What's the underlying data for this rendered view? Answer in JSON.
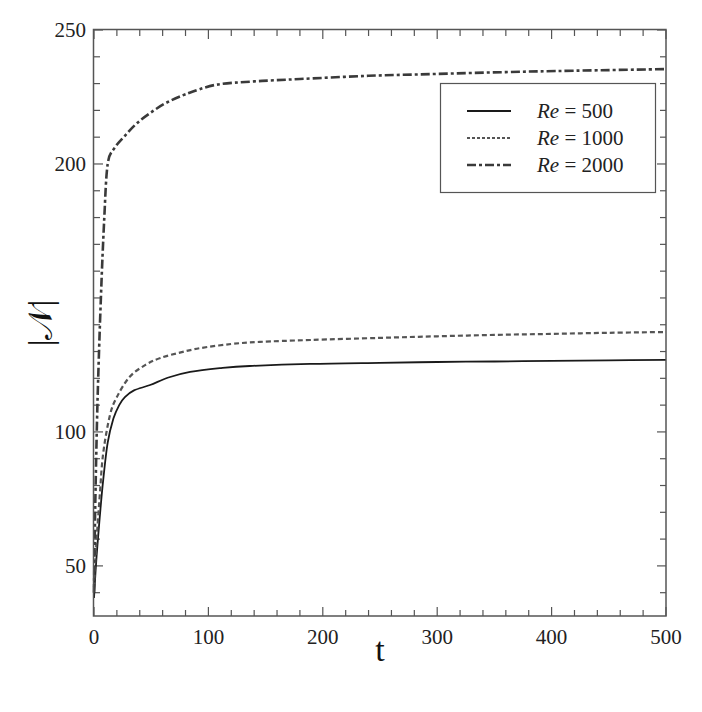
{
  "chart_data": {
    "type": "line",
    "title": "",
    "xlabel": "t",
    "ylabel": "|𝒩|",
    "xlim": [
      0,
      500
    ],
    "ylim": [
      31.3,
      250
    ],
    "xticks": [
      0,
      100,
      200,
      300,
      400,
      500
    ],
    "xtick_labels": [
      "0",
      "100",
      "200",
      "300",
      "400",
      "500"
    ],
    "yticks": [
      50,
      100,
      200,
      250
    ],
    "ytick_labels": [
      "50",
      "100",
      "200",
      "250"
    ],
    "x_minor_step": 20,
    "y_minor_step": 10,
    "grid": false,
    "legend_position": "upper right",
    "series": [
      {
        "name": "Re = 500",
        "label_italic": "Re",
        "label_rest": " = 500",
        "style": "solid",
        "color": "#1a1a1a",
        "x": [
          0,
          2,
          5,
          8,
          12,
          17,
          22,
          27,
          35,
          49,
          65,
          84,
          110,
          136,
          189,
          250,
          300,
          350,
          400,
          450,
          500
        ],
        "y": [
          38,
          52,
          68,
          82,
          96,
          105,
          110,
          113,
          115.5,
          117.5,
          120.3,
          122.4,
          123.8,
          124.6,
          125.4,
          125.8,
          126.1,
          126.3,
          126.5,
          126.7,
          126.9
        ]
      },
      {
        "name": "Re = 1000",
        "label_italic": "Re",
        "label_rest": " = 1000",
        "style": "dotted",
        "color": "#555555",
        "x": [
          0,
          2,
          5,
          8,
          14,
          20,
          31,
          45,
          58,
          75,
          93,
          120,
          145,
          189,
          250,
          300,
          350,
          400,
          450,
          500
        ],
        "y": [
          42,
          58,
          76,
          92,
          106.3,
          113,
          120.5,
          125,
          127.6,
          129.6,
          131.3,
          132.8,
          133.6,
          134.3,
          135.1,
          135.7,
          136.2,
          136.6,
          137.0,
          137.3
        ]
      },
      {
        "name": "Re = 2000",
        "label_italic": "Re",
        "label_rest": " = 2000",
        "style": "dashdot",
        "color": "#3a3a3a",
        "x": [
          0,
          1,
          3,
          6,
          9,
          12,
          18,
          27,
          37,
          49,
          63,
          80,
          106,
          140,
          180,
          240,
          300,
          360,
          420,
          500
        ],
        "y": [
          40,
          70,
          110,
          150,
          180,
          200,
          206,
          210.5,
          215,
          219,
          222.8,
          226,
          229.5,
          230.8,
          231.7,
          232.9,
          233.6,
          234.3,
          234.8,
          235.4
        ]
      }
    ]
  }
}
